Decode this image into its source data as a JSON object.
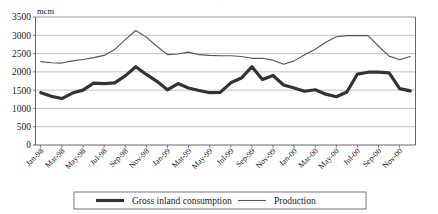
{
  "chart_data": {
    "type": "line",
    "title": "",
    "xlabel": "",
    "ylabel": "",
    "unit_label": "mcm",
    "ylim": [
      0,
      3500
    ],
    "ytick_values": [
      0,
      500,
      1000,
      1500,
      2000,
      2500,
      3000,
      3500
    ],
    "ytick_labels": [
      "0",
      "500",
      "1000",
      "1500",
      "2000",
      "2500",
      "3000",
      "3500"
    ],
    "grid": true,
    "legend_position": "bottom",
    "x": [
      "Jan-98",
      "Feb-98",
      "Mar-98",
      "Apr-98",
      "May-98",
      "Jun-98",
      "Jul-98",
      "Aug-98",
      "Sep-98",
      "Oct-98",
      "Nov-98",
      "Dec-98",
      "Jan-99",
      "Feb-99",
      "Mar-99",
      "Apr-99",
      "May-99",
      "Jun-99",
      "Jul-99",
      "Aug-99",
      "Sep-99",
      "Oct-99",
      "Nov-99",
      "Dec-99",
      "Jan-00",
      "Feb-00",
      "Mar-00",
      "Apr-00",
      "May-00",
      "Jun-00",
      "Jul-00",
      "Aug-00",
      "Sep-00",
      "Oct-00",
      "Nov-00",
      "Dec-00"
    ],
    "xtick_labels": [
      "Jan-98",
      "Mar-98",
      "May-98",
      "Jul-98",
      "Sep-98",
      "Nov-98",
      "Jan-99",
      "Mar-99",
      "May-99",
      "Jul-99",
      "Sep-99",
      "Nov-99",
      "Jan-00",
      "Mar-00",
      "May-00",
      "Jul-00",
      "Sep-00",
      "Nov-00"
    ],
    "series": [
      {
        "name": "Gross inland consumption",
        "color": "#333333",
        "width": 3.2,
        "values": [
          1430,
          1330,
          1270,
          1420,
          1500,
          1690,
          1680,
          1700,
          1890,
          2140,
          1930,
          1740,
          1510,
          1680,
          1560,
          1490,
          1430,
          1440,
          1700,
          1830,
          2140,
          1790,
          1900,
          1640,
          1560,
          1470,
          1510,
          1390,
          1320,
          1450,
          1940,
          1990,
          1990,
          1970,
          1540,
          1480
        ]
      },
      {
        "name": "Production",
        "color": "#555555",
        "width": 1.1,
        "values": [
          2280,
          2250,
          2240,
          2300,
          2340,
          2390,
          2450,
          2610,
          2880,
          3130,
          2950,
          2700,
          2470,
          2490,
          2540,
          2470,
          2450,
          2440,
          2440,
          2420,
          2370,
          2370,
          2320,
          2210,
          2300,
          2470,
          2620,
          2810,
          2960,
          2990,
          2990,
          2990,
          2700,
          2430,
          2330,
          2420
        ]
      }
    ],
    "legend": [
      {
        "label": "Gross inland consumption",
        "color": "#333333",
        "width": 3.2
      },
      {
        "label": "Production",
        "color": "#555555",
        "width": 1.1
      }
    ]
  },
  "ghost_top_text": "·"
}
